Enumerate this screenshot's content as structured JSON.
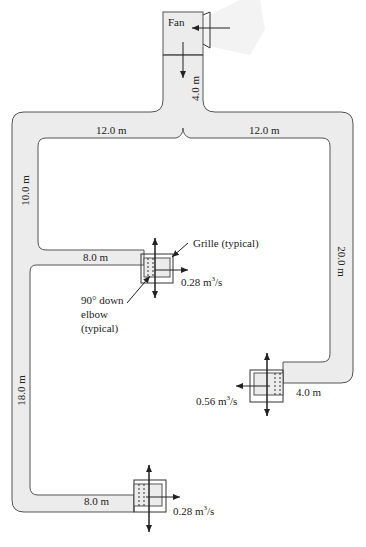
{
  "diagram": {
    "colors": {
      "duct_fill": "#ececec",
      "duct_stroke": "#555555",
      "line": "#222222",
      "text": "#222222"
    },
    "fan": {
      "label": "Fan"
    },
    "segments": {
      "fan_riser": "4.0 m",
      "top_left": "12.0 m",
      "top_right": "12.0 m",
      "left_upper": "10.0 m",
      "branch_1": "8.0 m",
      "right_vertical": "20.0 m",
      "branch_2": "4.0 m",
      "left_lower": "18.0 m",
      "branch_3": "8.0 m"
    },
    "outlets": {
      "grille_1_flow": "0.28 m",
      "grille_2_flow": "0.56 m",
      "grille_3_flow": "0.28 m",
      "flow_unit_exp": "3",
      "flow_unit_tail": "/s"
    },
    "annotations": {
      "grille": "Grille (typical)",
      "elbow_line1": "90° down",
      "elbow_line2": "elbow",
      "elbow_line3": "(typical)"
    }
  }
}
